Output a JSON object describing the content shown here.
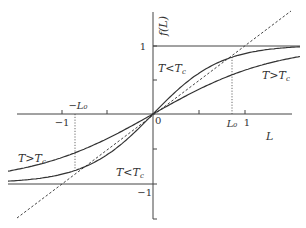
{
  "diagram": {
    "y_axis_label": "f(L)",
    "x_axis_label": "L",
    "origin_label": "0",
    "x_ticks": [
      {
        "value": -1,
        "label": "−1"
      },
      {
        "value": -0.5,
        "label": ""
      },
      {
        "value": 0.5,
        "label": ""
      },
      {
        "value": 1,
        "label": "1"
      }
    ],
    "y_ticks": [
      {
        "value": 1,
        "label": "1"
      },
      {
        "value": -1,
        "label": "−1"
      }
    ],
    "markers": {
      "L0": "L₀",
      "neg_L0": "−L₀",
      "L0_value": 0.86
    },
    "curves": [
      {
        "name": "T<Tc",
        "label_T": "T",
        "label_rel": "<",
        "label_Tc": "T",
        "label_sub": "c",
        "style": "solid",
        "steepness": 1.36
      },
      {
        "name": "T>Tc",
        "label_T": "T",
        "label_rel": ">",
        "label_Tc": "T",
        "label_sub": "c",
        "style": "solid",
        "steepness": 0.75
      },
      {
        "name": "f=L",
        "style": "dashed",
        "slope": 1
      }
    ],
    "asymptotes": [
      {
        "value": 1,
        "side": "positive"
      },
      {
        "value": -1,
        "side": "negative"
      }
    ],
    "colors": {
      "line": "#333333",
      "background": "#ffffff"
    }
  }
}
